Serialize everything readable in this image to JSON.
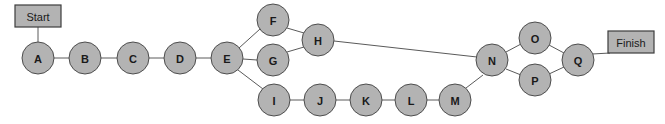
{
  "diagram": {
    "background_color": "#ffffff",
    "node_fill": "#b3b3b3",
    "node_stroke": "#4d4d4d",
    "edge_color": "#5a5a5a",
    "terminals": [
      {
        "id": "start",
        "label": "Start",
        "x": 15,
        "y": 5,
        "width": 46,
        "height": 22
      },
      {
        "id": "finish",
        "label": "Finish",
        "x": 608,
        "y": 31,
        "width": 46,
        "height": 22
      }
    ],
    "nodes": [
      {
        "id": "A",
        "label": "A",
        "cx": 38,
        "cy": 58,
        "r": 16
      },
      {
        "id": "B",
        "label": "B",
        "cx": 85,
        "cy": 58,
        "r": 16
      },
      {
        "id": "C",
        "label": "C",
        "cx": 133,
        "cy": 58,
        "r": 16
      },
      {
        "id": "D",
        "label": "D",
        "cx": 180,
        "cy": 58,
        "r": 16
      },
      {
        "id": "E",
        "label": "E",
        "cx": 227,
        "cy": 58,
        "r": 16
      },
      {
        "id": "F",
        "label": "F",
        "cx": 273,
        "cy": 20,
        "r": 16
      },
      {
        "id": "G",
        "label": "G",
        "cx": 273,
        "cy": 60,
        "r": 16
      },
      {
        "id": "H",
        "label": "H",
        "cx": 318,
        "cy": 40,
        "r": 16
      },
      {
        "id": "I",
        "label": "I",
        "cx": 274,
        "cy": 100,
        "r": 16
      },
      {
        "id": "J",
        "label": "J",
        "cx": 320,
        "cy": 100,
        "r": 16
      },
      {
        "id": "K",
        "label": "K",
        "cx": 366,
        "cy": 100,
        "r": 16
      },
      {
        "id": "L",
        "label": "L",
        "cx": 411,
        "cy": 100,
        "r": 16
      },
      {
        "id": "M",
        "label": "M",
        "cx": 455,
        "cy": 100,
        "r": 16
      },
      {
        "id": "N",
        "label": "N",
        "cx": 492,
        "cy": 60,
        "r": 16
      },
      {
        "id": "O",
        "label": "O",
        "cx": 535,
        "cy": 38,
        "r": 16
      },
      {
        "id": "P",
        "label": "P",
        "cx": 535,
        "cy": 80,
        "r": 16
      },
      {
        "id": "Q",
        "label": "Q",
        "cx": 578,
        "cy": 60,
        "r": 16
      }
    ],
    "edges": [
      {
        "from": "start",
        "to": "A",
        "x1": 38,
        "y1": 27,
        "x2": 38,
        "y2": 42
      },
      {
        "from": "A",
        "to": "B",
        "x1": 54,
        "y1": 58,
        "x2": 69,
        "y2": 58
      },
      {
        "from": "B",
        "to": "C",
        "x1": 101,
        "y1": 58,
        "x2": 117,
        "y2": 58
      },
      {
        "from": "C",
        "to": "D",
        "x1": 149,
        "y1": 58,
        "x2": 164,
        "y2": 58
      },
      {
        "from": "D",
        "to": "E",
        "x1": 196,
        "y1": 58,
        "x2": 211,
        "y2": 58
      },
      {
        "from": "E",
        "to": "F",
        "x1": 239,
        "y1": 48,
        "x2": 260,
        "y2": 29
      },
      {
        "from": "E",
        "to": "G",
        "x1": 243,
        "y1": 59,
        "x2": 257,
        "y2": 60
      },
      {
        "from": "E",
        "to": "I",
        "x1": 238,
        "y1": 70,
        "x2": 263,
        "y2": 89
      },
      {
        "from": "F",
        "to": "H",
        "x1": 287,
        "y1": 28,
        "x2": 304,
        "y2": 33
      },
      {
        "from": "G",
        "to": "H",
        "x1": 287,
        "y1": 52,
        "x2": 304,
        "y2": 47
      },
      {
        "from": "H",
        "to": "N",
        "x1": 334,
        "y1": 41,
        "x2": 477,
        "y2": 57
      },
      {
        "from": "I",
        "to": "J",
        "x1": 290,
        "y1": 100,
        "x2": 304,
        "y2": 100
      },
      {
        "from": "J",
        "to": "K",
        "x1": 336,
        "y1": 100,
        "x2": 350,
        "y2": 100
      },
      {
        "from": "K",
        "to": "L",
        "x1": 382,
        "y1": 100,
        "x2": 395,
        "y2": 100
      },
      {
        "from": "L",
        "to": "M",
        "x1": 427,
        "y1": 100,
        "x2": 439,
        "y2": 100
      },
      {
        "from": "M",
        "to": "N",
        "x1": 466,
        "y1": 88,
        "x2": 483,
        "y2": 75
      },
      {
        "from": "N",
        "to": "O",
        "x1": 506,
        "y1": 52,
        "x2": 521,
        "y2": 44
      },
      {
        "from": "N",
        "to": "P",
        "x1": 506,
        "y1": 69,
        "x2": 521,
        "y2": 75
      },
      {
        "from": "O",
        "to": "Q",
        "x1": 549,
        "y1": 45,
        "x2": 564,
        "y2": 53
      },
      {
        "from": "P",
        "to": "Q",
        "x1": 549,
        "y1": 74,
        "x2": 564,
        "y2": 67
      },
      {
        "from": "Q",
        "to": "finish",
        "x1": 592,
        "y1": 54,
        "x2": 610,
        "y2": 53
      }
    ]
  }
}
